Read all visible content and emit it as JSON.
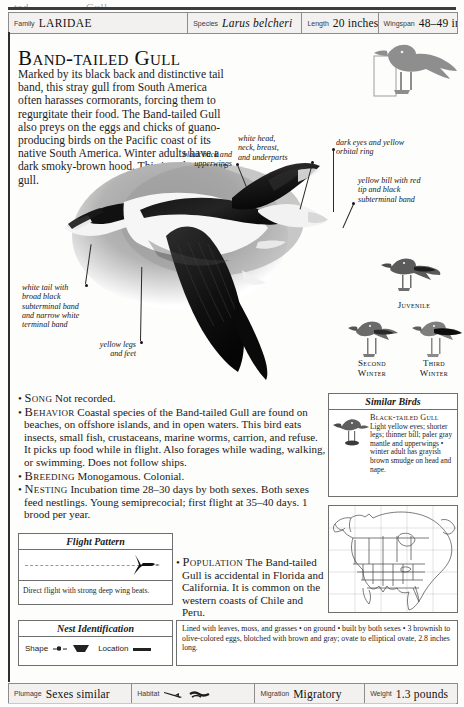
{
  "top_scrap": {
    "fragments": [
      "ted",
      "Gull"
    ]
  },
  "header": {
    "fields": [
      {
        "label": "Family",
        "value": "LARIDAE",
        "style": "caps"
      },
      {
        "label": "Species",
        "value": "Larus belcheri",
        "style": "sci"
      },
      {
        "label": "Length",
        "value": "20 inches",
        "style": "plain"
      },
      {
        "label": "Wingspan",
        "value": "48–49 inches",
        "style": "plain"
      }
    ]
  },
  "title": "Band-tailed Gull",
  "intro": "Marked by its black back and distinctive tail band, this stray gull from South America often harasses cormorants, forcing them to regurgitate their food. The Band-tailed Gull also preys on the eggs and chicks of guano-producing birds on the Pacific coast of its native South America. Winter adults have a dark smoky-brown hood. This is a three-year gull.",
  "annotations": {
    "black_back": "black back and\nupperwings",
    "white_head": "white head,\nneck, breast,\nand underparts",
    "dark_eyes": "dark eyes and yellow\norbital ring",
    "yellow_bill": "yellow bill with red\ntip and black\nsubterminal band",
    "white_tail": "white tail with\nbroad black\nsubterminal band\nand narrow white\nterminal band",
    "yellow_legs": "yellow legs\nand feet"
  },
  "age_figures": [
    {
      "caption": "Juvenile"
    },
    {
      "caption": "Second\nWinter"
    },
    {
      "caption": "Third\nWinter"
    }
  ],
  "facts": [
    {
      "keyword": "Song",
      "text": "Not recorded."
    },
    {
      "keyword": "Behavior",
      "text": "Coastal species of the Band-tailed Gull are found on beaches, on offshore islands, and in open waters. This bird eats insects, small fish, crustaceans, marine worms, carrion, and refuse. It picks up food while in flight. Also forages while wading, walking, or swimming. Does not follow ships."
    },
    {
      "keyword": "Breeding",
      "text": "Monogamous. Colonial."
    },
    {
      "keyword": "Nesting",
      "text": "Incubation time 28–30 days by both sexes. Both sexes feed nestlings. Young semiprecocial; first flight at 35–40 days. 1 brood per year."
    },
    {
      "keyword": "Population",
      "text": "The Band-tailed Gull is accidental in Florida and California. It is common on the western coasts of Chile and Peru."
    }
  ],
  "similar_birds": {
    "header": "Similar Birds",
    "entries": [
      {
        "name": "Black-tailed Gull",
        "text": "Light yellow eyes; shorter legs; thinner bill; paler gray mantle and upperwings",
        "note": "• winter adult has grayish brown smudge on head and nape."
      }
    ]
  },
  "flight_pattern": {
    "header": "Flight Pattern",
    "caption": "Direct flight with strong deep wing beats."
  },
  "nest_identification": {
    "header": "Nest Identification",
    "shape_label": "Shape",
    "location_label": "Location",
    "text": "Lined with leaves, moss, and grasses • on ground • built by both sexes • 3 brownish to olive-colored eggs, blotched with brown and gray; ovate to elliptical ovate, 2.8 inches long."
  },
  "footer": {
    "fields": [
      {
        "label": "Plumage",
        "value": "Sexes similar",
        "style": "plain"
      },
      {
        "label": "Habitat",
        "value": "",
        "style": "icons"
      },
      {
        "label": "Migration",
        "value": "Migratory",
        "style": "plain"
      },
      {
        "label": "Weight",
        "value": "1.3 pounds",
        "style": "plain"
      }
    ]
  },
  "colors": {
    "rule": "#2e2e2e",
    "box_border": "#6f6f6f",
    "bar_fill": "#f2f1ef",
    "silhouette": "#8e8e8e",
    "text": "#1a1a1a"
  }
}
